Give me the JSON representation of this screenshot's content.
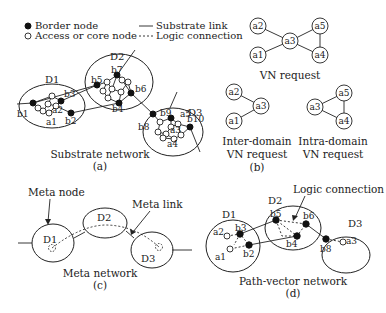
{
  "legend": {
    "border_node": "Border node",
    "access_node": "Access or core node",
    "substrate_link": "Substrate link",
    "logic_connection": "Logic connection"
  },
  "panel_a": {
    "caption": "Substrate network",
    "tag": "(a)",
    "domains": [
      "D1",
      "D2",
      "D3"
    ],
    "nodes": [
      "b1",
      "b2",
      "b3",
      "a1",
      "a2",
      "b4",
      "b5",
      "b6",
      "b7",
      "b8",
      "b9",
      "b10",
      "a3",
      "a4",
      "a5"
    ]
  },
  "panel_b": {
    "vn_request": {
      "caption": "VN request",
      "nodes": [
        "a1",
        "a2",
        "a3",
        "a4",
        "a5"
      ]
    },
    "inter": {
      "caption_line1": "Inter-domain",
      "caption_line2": "VN request",
      "nodes": [
        "a1",
        "a2",
        "a3"
      ]
    },
    "intra": {
      "caption_line1": "Intra-domain",
      "caption_line2": "VN request",
      "nodes": [
        "a3",
        "a4",
        "a5"
      ]
    },
    "tag": "(b)"
  },
  "panel_c": {
    "caption": "Meta network",
    "tag": "(c)",
    "meta_node": "Meta node",
    "meta_link": "Meta link",
    "domains": [
      "D1",
      "D2",
      "D3"
    ]
  },
  "panel_d": {
    "caption": "Path-vector network",
    "tag": "(d)",
    "logic_connection": "Logic connection",
    "domains": [
      "D1",
      "D2",
      "D3"
    ],
    "nodes": [
      "a1",
      "a2",
      "b2",
      "b3",
      "b4",
      "b5",
      "b6",
      "b8",
      "a3"
    ]
  }
}
